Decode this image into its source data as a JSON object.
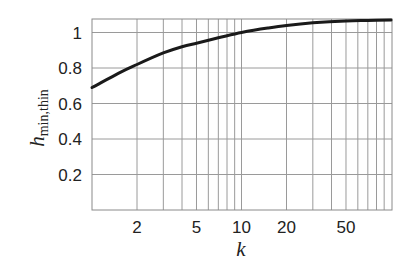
{
  "chart_data": {
    "type": "line",
    "title": "",
    "xlabel": "k",
    "ylabel": "h",
    "ylabel_subscript": "min,thin",
    "xscale": "log",
    "xlim": [
      1,
      100
    ],
    "ylim": [
      0,
      1.08
    ],
    "grid": true,
    "legend": null,
    "x_ticks": [
      {
        "value": 2,
        "label": "2"
      },
      {
        "value": 5,
        "label": "5"
      },
      {
        "value": 10,
        "label": "10"
      },
      {
        "value": 20,
        "label": "20"
      },
      {
        "value": 50,
        "label": "50"
      }
    ],
    "x_minor_gridlines": [
      2,
      3,
      4,
      5,
      6,
      7,
      8,
      9,
      10,
      20,
      30,
      40,
      50,
      60,
      70,
      80,
      90
    ],
    "y_ticks": [
      {
        "value": 0.2,
        "label": "0.2"
      },
      {
        "value": 0.4,
        "label": "0.4"
      },
      {
        "value": 0.6,
        "label": "0.6"
      },
      {
        "value": 0.8,
        "label": "0.8"
      },
      {
        "value": 1.0,
        "label": "1"
      }
    ],
    "series": [
      {
        "name": "h_min,thin",
        "color": "#1a1a1a",
        "x": [
          1,
          1.5,
          2,
          3,
          4,
          5,
          7,
          10,
          15,
          20,
          30,
          50,
          70,
          100
        ],
        "y": [
          0.69,
          0.77,
          0.82,
          0.885,
          0.92,
          0.94,
          0.97,
          1.0,
          1.025,
          1.04,
          1.055,
          1.065,
          1.068,
          1.07
        ]
      }
    ]
  }
}
